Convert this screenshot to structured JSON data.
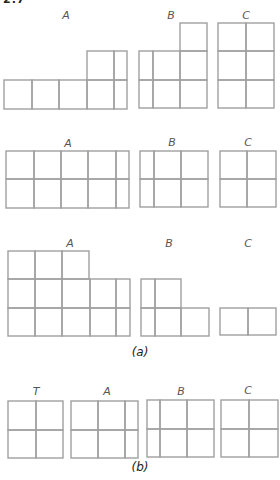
{
  "header_fragment": "2.7",
  "part_a": {
    "caption": "(a)",
    "caption_pos": [
      140,
      356
    ],
    "rows": [
      {
        "figures": [
          {
            "label": "A",
            "label_pos": [
              66,
              19
            ],
            "cells": [
              [
                4,
                80,
                28,
                29
              ],
              [
                32,
                80,
                27,
                29
              ],
              [
                59,
                80,
                28,
                29
              ],
              [
                87,
                80,
                27,
                29
              ],
              [
                114,
                80,
                13,
                29
              ],
              [
                87,
                51,
                27,
                29
              ],
              [
                114,
                51,
                13,
                29
              ]
            ]
          },
          {
            "label": "B",
            "label_pos": [
              171,
              19
            ],
            "cells": [
              [
                139,
                51,
                14,
                29
              ],
              [
                153,
                51,
                27,
                29
              ],
              [
                180,
                51,
                27,
                29
              ],
              [
                139,
                80,
                14,
                28
              ],
              [
                153,
                80,
                27,
                28
              ],
              [
                180,
                80,
                27,
                28
              ],
              [
                180,
                23,
                27,
                28
              ]
            ]
          },
          {
            "label": "C",
            "label_pos": [
              246,
              19
            ],
            "cells": [
              [
                218,
                23,
                28,
                28
              ],
              [
                246,
                23,
                28,
                28
              ],
              [
                218,
                51,
                28,
                29
              ],
              [
                246,
                51,
                28,
                29
              ],
              [
                218,
                80,
                28,
                28
              ],
              [
                246,
                80,
                28,
                28
              ]
            ]
          }
        ]
      },
      {
        "figures": [
          {
            "label": "A",
            "label_pos": [
              68,
              147
            ],
            "cells": [
              [
                6,
                151,
                28,
                28
              ],
              [
                34,
                151,
                27,
                28
              ],
              [
                61,
                151,
                27,
                28
              ],
              [
                88,
                151,
                28,
                28
              ],
              [
                116,
                151,
                13,
                28
              ],
              [
                6,
                179,
                28,
                29
              ],
              [
                34,
                179,
                27,
                29
              ],
              [
                61,
                179,
                27,
                29
              ],
              [
                88,
                179,
                28,
                29
              ],
              [
                116,
                179,
                13,
                29
              ]
            ]
          },
          {
            "label": "B",
            "label_pos": [
              172,
              146
            ],
            "cells": [
              [
                140,
                151,
                14,
                28
              ],
              [
                154,
                151,
                27,
                28
              ],
              [
                181,
                151,
                27,
                28
              ],
              [
                140,
                179,
                14,
                28
              ],
              [
                154,
                179,
                27,
                28
              ],
              [
                181,
                179,
                27,
                28
              ]
            ]
          },
          {
            "label": "C",
            "label_pos": [
              248,
              146
            ],
            "cells": [
              [
                220,
                151,
                27,
                28
              ],
              [
                247,
                151,
                29,
                28
              ],
              [
                220,
                179,
                27,
                28
              ],
              [
                247,
                179,
                29,
                28
              ]
            ]
          }
        ]
      },
      {
        "figures": [
          {
            "label": "A",
            "label_pos": [
              70,
              247
            ],
            "cells": [
              [
                8,
                251,
                27,
                28
              ],
              [
                35,
                251,
                27,
                28
              ],
              [
                62,
                251,
                27,
                28
              ],
              [
                8,
                279,
                27,
                29
              ],
              [
                35,
                279,
                27,
                29
              ],
              [
                62,
                279,
                28,
                29
              ],
              [
                90,
                279,
                26,
                29
              ],
              [
                116,
                279,
                14,
                29
              ],
              [
                8,
                308,
                27,
                28
              ],
              [
                35,
                308,
                27,
                28
              ],
              [
                62,
                308,
                28,
                28
              ],
              [
                90,
                308,
                26,
                28
              ],
              [
                116,
                308,
                14,
                28
              ]
            ]
          },
          {
            "label": "B",
            "label_pos": [
              169,
              247
            ],
            "cells": [
              [
                141,
                279,
                14,
                29
              ],
              [
                155,
                279,
                26,
                29
              ],
              [
                141,
                308,
                14,
                28
              ],
              [
                155,
                308,
                26,
                28
              ],
              [
                181,
                308,
                28,
                28
              ]
            ]
          },
          {
            "label": "C",
            "label_pos": [
              248,
              247
            ],
            "cells": [
              [
                220,
                308,
                28,
                27
              ],
              [
                248,
                308,
                28,
                27
              ]
            ]
          }
        ]
      }
    ]
  },
  "part_b": {
    "caption": "(b)",
    "caption_pos": [
      140,
      471
    ],
    "figures": [
      {
        "label": "T",
        "label_pos": [
          36,
          395
        ],
        "cells": [
          [
            8,
            401,
            28,
            29
          ],
          [
            36,
            401,
            27,
            29
          ],
          [
            8,
            430,
            28,
            28
          ],
          [
            36,
            430,
            27,
            28
          ]
        ]
      },
      {
        "label": "A",
        "label_pos": [
          107,
          395
        ],
        "cells": [
          [
            71,
            401,
            27,
            29
          ],
          [
            98,
            401,
            27,
            29
          ],
          [
            125,
            401,
            13,
            29
          ],
          [
            71,
            430,
            27,
            28
          ],
          [
            98,
            430,
            27,
            28
          ],
          [
            125,
            430,
            13,
            28
          ]
        ]
      },
      {
        "label": "B",
        "label_pos": [
          181,
          395
        ],
        "cells": [
          [
            147,
            400,
            13,
            29
          ],
          [
            160,
            400,
            27,
            29
          ],
          [
            187,
            400,
            27,
            29
          ],
          [
            147,
            429,
            13,
            28
          ],
          [
            160,
            429,
            27,
            28
          ],
          [
            187,
            429,
            27,
            28
          ]
        ]
      },
      {
        "label": "C",
        "label_pos": [
          248,
          394
        ],
        "cells": [
          [
            221,
            400,
            28,
            29
          ],
          [
            249,
            400,
            29,
            29
          ],
          [
            221,
            429,
            28,
            28
          ],
          [
            249,
            429,
            29,
            28
          ]
        ]
      }
    ]
  },
  "style": {
    "line_color": "#a0a0a0",
    "label_color": "#555555",
    "caption_color": "#222222"
  }
}
